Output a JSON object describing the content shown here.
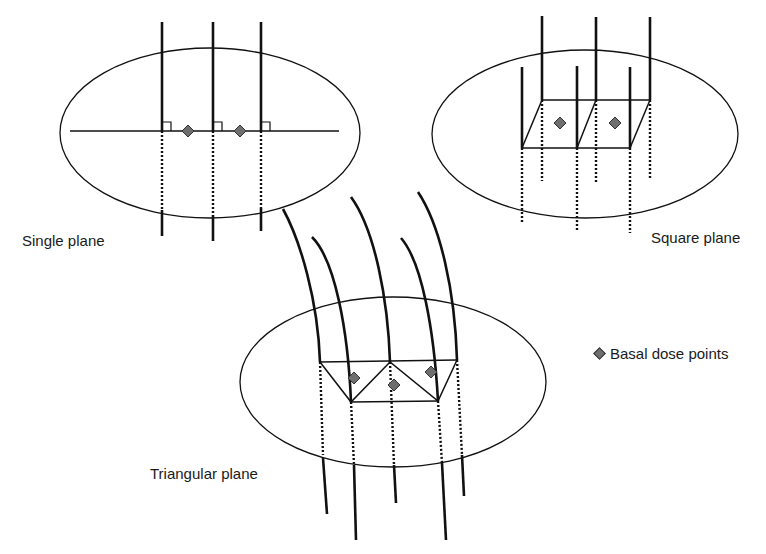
{
  "diagram": {
    "panels": [
      {
        "id": "single",
        "label": "Single plane"
      },
      {
        "id": "square",
        "label": "Square plane"
      },
      {
        "id": "triangular",
        "label": "Triangular plane"
      }
    ],
    "legend": {
      "marker": "diamond",
      "label": "Basal dose points"
    },
    "colors": {
      "line": "#111111",
      "marker_fill": "#6e6e6e",
      "background": "#ffffff"
    }
  }
}
